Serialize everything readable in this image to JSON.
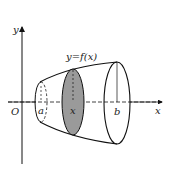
{
  "diagram": {
    "labels": {
      "y_axis": "y",
      "x_axis": "x",
      "origin": "O",
      "a": "a",
      "x": "x",
      "b": "b",
      "curve": "y=f(x)"
    },
    "colors": {
      "stroke": "#111111",
      "cross_section_fill": "#9a9a9a",
      "background": "#ffffff"
    }
  }
}
